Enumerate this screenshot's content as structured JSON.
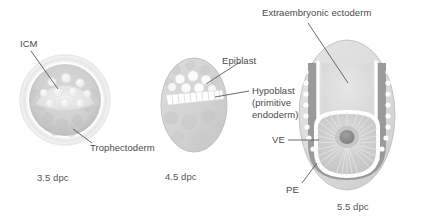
{
  "figure": {
    "type": "biological-diagram",
    "background_color": "#ffffff",
    "text_color": "#4a4a4a"
  },
  "palette": {
    "zona_pellucida": "#efefef",
    "trophectoderm": "#c9c9c9",
    "icm": "#e3e3e3",
    "cell_fill": "#f2f2f2",
    "egg_cylinder_body": "#d4d4d4",
    "hypoblast_white": "#ffffff",
    "visceral_endoderm": "#9a9a9a",
    "extraembryonic_ectoderm": "#dcdcdc",
    "epiblast_chamber": "#d0d0d0",
    "proamniotic_cavity": "#8e8e8e",
    "leader_line": "#5a5a5a"
  },
  "stages": [
    {
      "id": "stage-3-5",
      "stage_label": "3.5 dpc",
      "name": "blastocyst",
      "labels": [
        {
          "id": "icm",
          "text": "ICM",
          "full_name": "inner cell mass"
        },
        {
          "id": "trophectoderm",
          "text": "Trophectoderm"
        }
      ]
    },
    {
      "id": "stage-4-5",
      "stage_label": "4.5 dpc",
      "name": "implanting-embryo",
      "labels": [
        {
          "id": "epiblast",
          "text": "Epiblast"
        },
        {
          "id": "hypoblast",
          "text": "Hypoblast"
        },
        {
          "id": "hypoblast-sub-1",
          "text": "(primitive"
        },
        {
          "id": "hypoblast-sub-2",
          "text": "endoderm)"
        }
      ]
    },
    {
      "id": "stage-5-5",
      "stage_label": "5.5 dpc",
      "name": "egg-cylinder",
      "labels": [
        {
          "id": "exe",
          "text": "Extraembryonic ectoderm"
        },
        {
          "id": "ve",
          "text": "VE",
          "full_name": "visceral endoderm"
        },
        {
          "id": "pe",
          "text": "PE",
          "full_name": "parietal endoderm"
        }
      ]
    }
  ]
}
